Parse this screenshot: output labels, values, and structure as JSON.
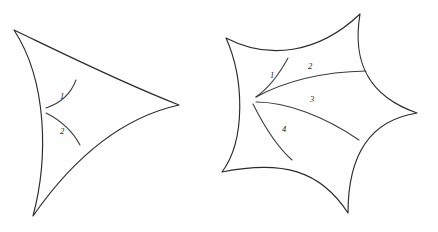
{
  "figure": {
    "background_color": "#fefefe",
    "stroke_color": "#2b2b2b",
    "label_color": "#1a1a1a",
    "width": 438,
    "height": 232,
    "panels": [
      {
        "id": "left-panel",
        "name": "curvilinear-triangle",
        "description": "Three-cusped curvilinear triangle (deltoid-like) with two interior arcs from the left vertex",
        "cusps": [
          {
            "name": "top-left-cusp",
            "x": 14,
            "y": 30
          },
          {
            "name": "right-cusp",
            "x": 179,
            "y": 105
          },
          {
            "name": "bottom-cusp",
            "x": 33,
            "y": 216
          }
        ],
        "outline_path": "M 14,30 C 60,52 120,82 179,105 C 120,118 72,160 33,216 C 48,160 48,82 14,30 Z",
        "inner_arcs": [
          {
            "id": "arc-1",
            "label": "1",
            "path": "M 46,108 C 58,104 70,96 76,80",
            "label_x": 62,
            "label_y": 97
          },
          {
            "id": "arc-2",
            "label": "2",
            "path": "M 46,113 C 60,120 72,130 80,145",
            "label_x": 62,
            "label_y": 132
          }
        ],
        "vertex_point": {
          "x": 46,
          "y": 110
        }
      },
      {
        "id": "right-panel",
        "name": "curvilinear-pentagon",
        "description": "Five-cusped curvilinear star polygon with four interior arcs from the left vertex",
        "cusps": [
          {
            "name": "left-cusp",
            "x": 226,
            "y": 38
          },
          {
            "name": "top-cusp",
            "x": 360,
            "y": 14
          },
          {
            "name": "right-cusp",
            "x": 417,
            "y": 113
          },
          {
            "name": "bottom-cusp",
            "x": 348,
            "y": 213
          },
          {
            "name": "bottom-left-cusp",
            "x": 222,
            "y": 172
          }
        ],
        "outline_path": "M 226,38 C 268,60 318,54 360,14 C 352,62 368,96 417,113 C 372,120 348,152 348,213 C 320,170 282,160 222,172 C 246,140 244,78 226,38 Z",
        "inner_arcs": [
          {
            "id": "arc-1",
            "label": "1",
            "path": "M 256,97 C 266,90 276,80 288,58",
            "label_x": 272,
            "label_y": 76
          },
          {
            "id": "arc-2",
            "label": "2",
            "path": "M 256,97 C 280,84 316,72 366,71",
            "label_x": 310,
            "label_y": 67
          },
          {
            "id": "arc-3",
            "label": "3",
            "path": "M 256,102 C 286,102 324,116 359,140",
            "label_x": 312,
            "label_y": 100
          },
          {
            "id": "arc-4",
            "label": "4",
            "path": "M 253,104 C 262,122 274,144 292,160",
            "label_x": 284,
            "label_y": 130
          }
        ],
        "vertex_point": {
          "x": 256,
          "y": 100
        }
      }
    ]
  }
}
